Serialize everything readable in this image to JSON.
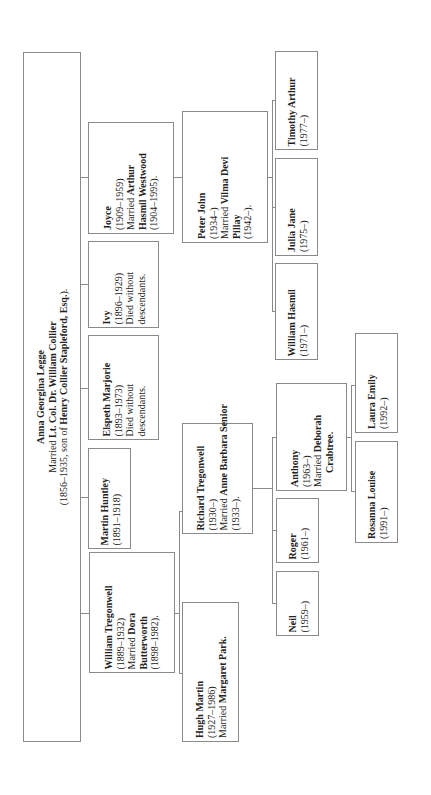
{
  "root": {
    "name": "Anna Georgina Legge",
    "married_prefix": "Married ",
    "spouse": "Lt. Col. Dr. William Collier",
    "dates": "(1856–1935, son of ",
    "father": "Henry Collier Stapleford, Esq.",
    "dates_suffix": ")."
  },
  "generation1": [
    {
      "id": "joyce",
      "name": "Joyce",
      "dates": "(1909–1959)",
      "married_prefix": "Married ",
      "spouse_a": "Arthur",
      "spouse_b": "Hasmil Westwood",
      "spouse_dates": "(1904–1995)."
    },
    {
      "id": "ivy",
      "name": "Ivy",
      "dates": "(1896–1929)",
      "note_a": "Died without",
      "note_b": "descendants."
    },
    {
      "id": "elspeth",
      "name": "Elspeth Marjorie",
      "dates": "(1893–1973)",
      "note_a": "Died without",
      "note_b": "descendants."
    },
    {
      "id": "martin",
      "name": "Martin Huntley",
      "dates": "(1891–1918)"
    },
    {
      "id": "william",
      "name": "William Tregonwell",
      "dates": "(1889–1932)",
      "married_prefix": "Married ",
      "spouse_a": "Dora",
      "spouse_b": "Butterworth",
      "spouse_dates": "(1898–1982)."
    }
  ],
  "generation2": [
    {
      "id": "peter",
      "name": "Peter John",
      "dates": "(1934–)",
      "married_prefix": "Married ",
      "spouse_a": "Vilma Devi",
      "spouse_b": "Pillay",
      "spouse_dates": "(1942–)."
    },
    {
      "id": "richard",
      "name": "Richard Tregonwell",
      "dates": "(1930–)",
      "married_prefix": "Married ",
      "spouse_a": "Anne Barbara Senior",
      "spouse_dates": "(1933–)."
    },
    {
      "id": "hugh",
      "name": "Hugh Martin",
      "dates": "(1927–1986)",
      "married_prefix": "Married ",
      "spouse_a": "Margaret Park."
    }
  ],
  "generation3": [
    {
      "id": "timothy",
      "name": "Timothy Arthur",
      "dates": "(1977–)"
    },
    {
      "id": "julia",
      "name": "Julia Jane",
      "dates": "(1975–)"
    },
    {
      "id": "william_hasmil",
      "name": "William Hasmil",
      "dates": "(1971–)"
    },
    {
      "id": "anthony",
      "name": "Anthony",
      "dates": "(1963–)",
      "married_prefix": "Married ",
      "spouse_a": "Deborah",
      "spouse_b": "Crabtree."
    },
    {
      "id": "roger",
      "name": "Roger",
      "dates": "(1961–)"
    },
    {
      "id": "neil",
      "name": "Neil",
      "dates": "(1959–)"
    }
  ],
  "generation4": [
    {
      "id": "laura",
      "name": "Laura Emily",
      "dates": "(1992–)"
    },
    {
      "id": "rosanna",
      "name": "Rosanna Louise",
      "dates": "(1991–)"
    }
  ]
}
